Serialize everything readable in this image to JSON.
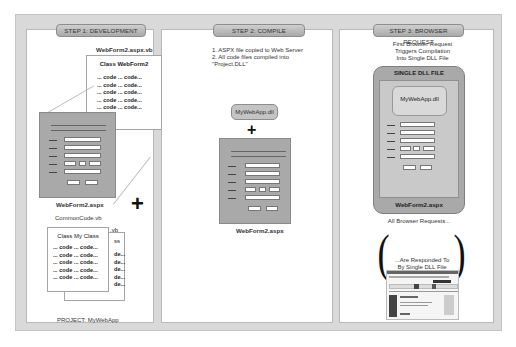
{
  "steps": [
    {
      "label": "STEP 1: DEVELOPMENT"
    },
    {
      "label": "STEP 2: COMPILE"
    },
    {
      "label": "STEP 3: BROWSER REQUEST"
    }
  ],
  "step1": {
    "codebehind_filename": "WebForm2.aspx.vb",
    "codebehind_class": "Class WebForm2",
    "code_lines": [
      "... code ... code...",
      "... code ... code...",
      "... code ... code...",
      "... code ... code...",
      "... code ... code..."
    ],
    "aspx_filename": "WebForm2.aspx",
    "plus": "+",
    "common_filename": "CommonCode.vb",
    "back_file_suffix": ".vb",
    "back_class_suffix": "ss",
    "back_line_suffix": "de...",
    "common_class": "Class My Class",
    "common_lines": [
      "... code ... code...",
      "... code ... code...",
      "... code ... code...",
      "... code ... code...",
      "... code ... code..."
    ],
    "project_label": "PROJECT: MyWebApp"
  },
  "step2": {
    "notes": [
      "1. ASPX file copied to Web Server",
      "2. All code files compiled into",
      "\"Project.DLL\""
    ],
    "dll_label": "MyWebApp.dll",
    "plus": "+",
    "aspx_filename": "WebForm2.aspx"
  },
  "step3": {
    "intro": [
      "First Browser Request",
      "Triggers Compilation",
      "Into Single DLL File"
    ],
    "container_title": "SINGLE DLL FILE",
    "dll_label": "MyWebApp.dll",
    "aspx_filename": "WebForm2.aspx",
    "all_requests": "All Browser Requests...",
    "left_paren": "(",
    "right_paren": ")",
    "responded": [
      "...Are Responded To",
      "By Single DLL File"
    ]
  }
}
